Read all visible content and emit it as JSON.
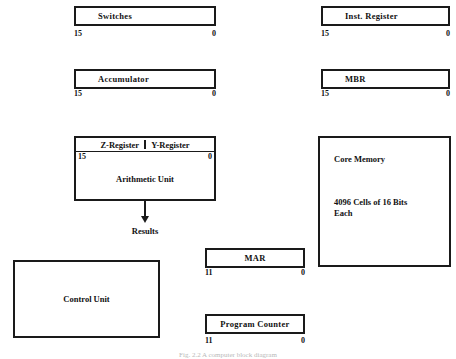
{
  "figure": {
    "caption": "Fig. 2.2  A computer block diagram",
    "background_color": "#ffffff",
    "ink_color": "#1a1a1a"
  },
  "registers": [
    {
      "id": "switches",
      "label": "Switches",
      "msb": "15",
      "lsb": "0"
    },
    {
      "id": "inst-register",
      "label": "Inst. Register",
      "msb": "15",
      "lsb": "0"
    },
    {
      "id": "accumulator",
      "label": "Accumulator",
      "msb": "15",
      "lsb": "0"
    },
    {
      "id": "mbr",
      "label": "MBR",
      "msb": "15",
      "lsb": "0"
    },
    {
      "id": "mar",
      "label": "MAR",
      "msb": "11",
      "lsb": "0"
    },
    {
      "id": "program-counter",
      "label": "Program Counter",
      "msb": "11",
      "lsb": "0"
    }
  ],
  "arithmetic_unit": {
    "header_left": "Z-Register",
    "header_right": "Y-Register",
    "msb": "15",
    "lsb": "0",
    "name": "Arithmetic Unit",
    "output_label": "Results"
  },
  "core_memory": {
    "title": "Core Memory",
    "description": "4096 Cells of 16 Bits\nEach"
  },
  "control_unit": {
    "label": "Control Unit"
  }
}
